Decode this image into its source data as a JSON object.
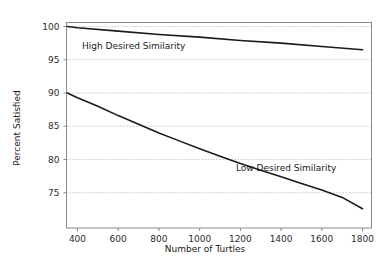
{
  "chart_data": {
    "type": "line",
    "title": "",
    "xlabel": "Number of Turtles",
    "ylabel": "Percent Satisfied",
    "xlim": [
      346,
      1844
    ],
    "ylim": [
      69.7,
      100.6
    ],
    "xticks": [
      400,
      600,
      800,
      1000,
      1200,
      1400,
      1600,
      1800
    ],
    "xtick_labels": [
      "400",
      "600",
      "800",
      "1000",
      "1200",
      "1400",
      "1600",
      "1800"
    ],
    "yticks": [
      75,
      80,
      85,
      90,
      95,
      100
    ],
    "ytick_labels": [
      "75",
      "80",
      "85",
      "90",
      "95",
      "100"
    ],
    "grid": "horizontal-dotted",
    "legend": "inline-annotations",
    "series": [
      {
        "name": "High Desired Similarity",
        "annotation": "High Desired Similarity",
        "x": [
          350,
          400,
          600,
          800,
          1000,
          1200,
          1400,
          1600,
          1800
        ],
        "values": [
          100.0,
          99.8,
          99.3,
          98.8,
          98.4,
          97.9,
          97.5,
          97.0,
          96.5
        ]
      },
      {
        "name": "Low Desired Similarity",
        "annotation": "Low Desired Similarity",
        "x": [
          350,
          400,
          500,
          600,
          700,
          800,
          900,
          1000,
          1100,
          1200,
          1300,
          1400,
          1500,
          1600,
          1700,
          1800
        ],
        "values": [
          90.0,
          89.3,
          88.0,
          86.6,
          85.3,
          84.0,
          82.8,
          81.6,
          80.5,
          79.4,
          78.4,
          77.4,
          76.4,
          75.4,
          74.3,
          72.6
        ]
      }
    ]
  },
  "axis_titles": {
    "x": "Number of Turtles",
    "y": "Percent Satisfied"
  },
  "annotations": {
    "high": "High Desired Similarity",
    "low": "Low Desired Similarity"
  },
  "colors": {
    "background": "#ffffff",
    "line": "#1a1a1a",
    "grid": "#b9b9b9",
    "frame": "#8a8a8a",
    "text": "#1a1a1a"
  }
}
